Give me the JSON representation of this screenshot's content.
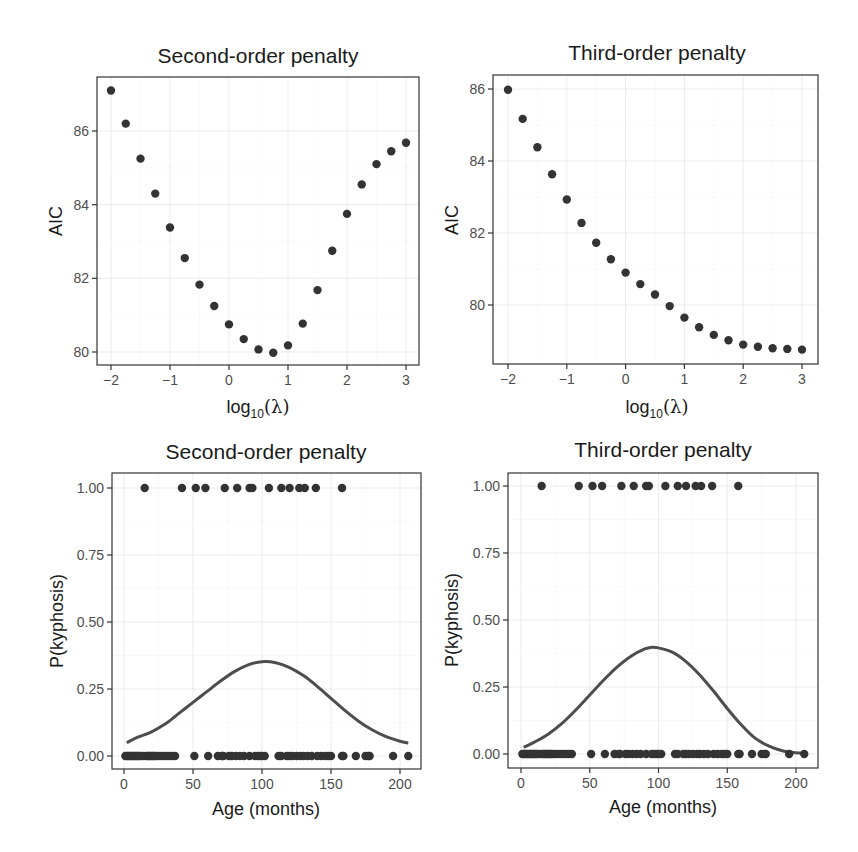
{
  "figure": {
    "panels": [
      {
        "id": "aic-second",
        "title": "Second-order penalty",
        "xlabel_main": "log",
        "xlabel_sub": "10",
        "xlabel_tail": "(λ)",
        "ylabel": "AIC"
      },
      {
        "id": "aic-third",
        "title": "Third-order penalty",
        "xlabel_main": "log",
        "xlabel_sub": "10",
        "xlabel_tail": "(λ)",
        "ylabel": "AIC"
      },
      {
        "id": "fit-second",
        "title": "Second-order penalty",
        "xlabel": "Age (months)",
        "ylabel": "P(kyphosis)"
      },
      {
        "id": "fit-third",
        "title": "Third-order penalty",
        "xlabel": "Age (months)",
        "ylabel": "P(kyphosis)"
      }
    ]
  },
  "chart_data": [
    {
      "type": "scatter",
      "title": "Second-order penalty",
      "xlabel": "log10(λ)",
      "ylabel": "AIC",
      "xticks": [
        "-2",
        "-1",
        "0",
        "1",
        "2",
        "3"
      ],
      "yticks": [
        "80",
        "82",
        "84",
        "86"
      ],
      "xlim": [
        -2.25,
        3.25
      ],
      "ylim": [
        79.7,
        87.4
      ],
      "grid": true,
      "x": [
        -2,
        -1.75,
        -1.5,
        -1.25,
        -1,
        -0.75,
        -0.5,
        -0.25,
        0,
        0.25,
        0.5,
        0.75,
        1,
        1.25,
        1.5,
        1.75,
        2,
        2.25,
        2.5,
        2.75,
        3
      ],
      "y": [
        87.1,
        86.2,
        85.25,
        84.3,
        83.38,
        82.55,
        81.83,
        81.25,
        80.75,
        80.35,
        80.07,
        79.98,
        80.18,
        80.77,
        81.68,
        82.75,
        83.75,
        84.55,
        85.1,
        85.45,
        85.68
      ]
    },
    {
      "type": "scatter",
      "title": "Third-order penalty",
      "xlabel": "log10(λ)",
      "ylabel": "AIC",
      "xticks": [
        "-2",
        "-1",
        "0",
        "1",
        "2",
        "3"
      ],
      "yticks": [
        "80",
        "82",
        "84",
        "86"
      ],
      "xlim": [
        -2.25,
        3.25
      ],
      "ylim": [
        78.6,
        86.4
      ],
      "grid": true,
      "x": [
        -2,
        -1.75,
        -1.5,
        -1.25,
        -1,
        -0.75,
        -0.5,
        -0.25,
        0,
        0.25,
        0.5,
        0.75,
        1,
        1.25,
        1.5,
        1.75,
        2,
        2.25,
        2.5,
        2.75,
        3
      ],
      "y": [
        85.98,
        85.17,
        84.38,
        83.63,
        82.93,
        82.28,
        81.73,
        81.27,
        80.9,
        80.58,
        80.29,
        79.97,
        79.65,
        79.38,
        79.17,
        79.02,
        78.9,
        78.84,
        78.8,
        78.78,
        78.76
      ]
    },
    {
      "type": "scatter+line",
      "title": "Second-order penalty",
      "xlabel": "Age (months)",
      "ylabel": "P(kyphosis)",
      "xticks": [
        "0",
        "50",
        "100",
        "150",
        "200"
      ],
      "yticks": [
        "0.00",
        "0.25",
        "0.50",
        "0.75",
        "1.00"
      ],
      "xlim": [
        -9,
        215
      ],
      "ylim": [
        -0.04,
        1.04
      ],
      "grid": true,
      "points_y1_x": [
        15,
        42,
        52,
        59,
        73,
        82,
        91,
        93,
        105,
        114,
        120,
        127,
        131,
        139,
        158
      ],
      "points_y0_x": [
        1,
        2,
        3,
        4,
        5,
        6,
        7,
        8,
        9,
        10,
        11,
        12,
        14,
        16,
        17,
        18,
        19,
        20,
        21,
        22,
        23,
        25,
        27,
        29,
        31,
        33,
        35,
        37,
        51,
        61,
        68,
        71,
        72,
        76,
        78,
        81,
        84,
        87,
        91,
        95,
        97,
        99,
        100,
        102,
        112,
        114,
        118,
        120,
        122,
        125,
        128,
        130,
        133,
        136,
        140,
        143,
        146,
        148,
        150,
        158,
        159,
        168,
        175,
        177,
        178,
        195,
        206
      ],
      "curve": {
        "x": [
          2,
          10,
          20,
          30,
          40,
          50,
          60,
          70,
          80,
          90,
          100,
          110,
          120,
          130,
          140,
          150,
          160,
          170,
          180,
          190,
          200,
          206
        ],
        "y": [
          0.05,
          0.07,
          0.09,
          0.12,
          0.16,
          0.2,
          0.24,
          0.28,
          0.315,
          0.34,
          0.352,
          0.348,
          0.33,
          0.3,
          0.26,
          0.215,
          0.17,
          0.13,
          0.097,
          0.072,
          0.055,
          0.048
        ]
      }
    },
    {
      "type": "scatter+line",
      "title": "Third-order penalty",
      "xlabel": "Age (months)",
      "ylabel": "P(kyphosis)",
      "xticks": [
        "0",
        "50",
        "100",
        "150",
        "200"
      ],
      "yticks": [
        "0.00",
        "0.25",
        "0.50",
        "0.75",
        "1.00"
      ],
      "xlim": [
        -9,
        215
      ],
      "ylim": [
        -0.04,
        1.04
      ],
      "grid": true,
      "points_y1_x": [
        15,
        42,
        52,
        59,
        73,
        82,
        91,
        93,
        105,
        114,
        120,
        127,
        131,
        139,
        158
      ],
      "points_y0_x": [
        1,
        2,
        3,
        4,
        5,
        6,
        7,
        8,
        9,
        10,
        11,
        12,
        14,
        16,
        17,
        18,
        19,
        20,
        21,
        22,
        23,
        25,
        27,
        29,
        31,
        33,
        35,
        37,
        51,
        61,
        68,
        71,
        72,
        76,
        78,
        81,
        84,
        87,
        91,
        95,
        97,
        99,
        100,
        102,
        112,
        114,
        118,
        120,
        122,
        125,
        128,
        130,
        133,
        136,
        140,
        143,
        146,
        148,
        150,
        158,
        159,
        168,
        175,
        177,
        178,
        195,
        206
      ],
      "curve": {
        "x": [
          2,
          10,
          20,
          30,
          40,
          50,
          60,
          70,
          80,
          90,
          95,
          100,
          110,
          120,
          130,
          140,
          150,
          160,
          170,
          180,
          190,
          200,
          206
        ],
        "y": [
          0.025,
          0.045,
          0.075,
          0.115,
          0.165,
          0.22,
          0.275,
          0.325,
          0.365,
          0.392,
          0.398,
          0.396,
          0.38,
          0.345,
          0.295,
          0.235,
          0.17,
          0.11,
          0.06,
          0.03,
          0.012,
          0.005,
          0.003
        ]
      }
    }
  ]
}
